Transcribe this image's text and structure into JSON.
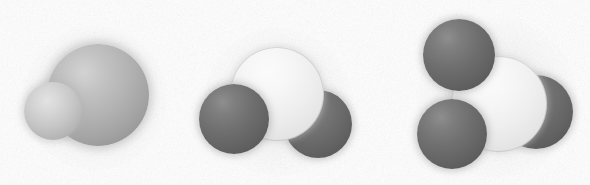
{
  "figure": {
    "background_color": "#ffffff",
    "width": 590,
    "height": 185,
    "style": "photocopied halftone / grainy scan"
  },
  "palette": {
    "light_grey": "#c2c2c2",
    "lighter_grey": "#d6d6d6",
    "white_atom": "#f2f2f2",
    "dark_grey": "#6b6b6b",
    "outline": "#9a9a9a",
    "background": "#ffffff"
  },
  "molecules": [
    {
      "id": "molecule-1",
      "label": "",
      "atom_count": 2,
      "atoms": [
        {
          "name": "central-sphere",
          "shade": "grey-lg",
          "cx": 98,
          "cy": 95,
          "r": 51,
          "z": 2
        },
        {
          "name": "attached-sphere",
          "shade": "grey-sm",
          "cx": 53,
          "cy": 111,
          "r": 29,
          "z": 3
        }
      ],
      "halo": {
        "cx": 95,
        "cy": 98,
        "r": 72
      }
    },
    {
      "id": "molecule-2",
      "label": "",
      "atom_count": 3,
      "atoms": [
        {
          "name": "right-dark-sphere",
          "shade": "dark",
          "cx": 318,
          "cy": 124,
          "r": 34,
          "z": 1
        },
        {
          "name": "central-white-sphere",
          "shade": "white",
          "cx": 277,
          "cy": 94,
          "r": 47,
          "z": 2
        },
        {
          "name": "left-dark-sphere",
          "shade": "dark",
          "cx": 234,
          "cy": 119,
          "r": 35,
          "z": 3
        }
      ],
      "halo": {
        "cx": 278,
        "cy": 102,
        "r": 74
      }
    },
    {
      "id": "molecule-3",
      "label": "",
      "atom_count": 4,
      "atoms": [
        {
          "name": "right-dark-sphere",
          "shade": "dark",
          "cx": 536,
          "cy": 112,
          "r": 37,
          "z": 1
        },
        {
          "name": "central-white-sphere",
          "shade": "white",
          "cx": 499,
          "cy": 104,
          "r": 48,
          "z": 2
        },
        {
          "name": "upper-left-dark-sphere",
          "shade": "dark",
          "cx": 459,
          "cy": 55,
          "r": 36,
          "z": 3
        },
        {
          "name": "lower-left-dark-sphere",
          "shade": "dark",
          "cx": 452,
          "cy": 134,
          "r": 35,
          "z": 3
        }
      ],
      "halo": {
        "cx": 497,
        "cy": 98,
        "r": 80
      }
    }
  ]
}
